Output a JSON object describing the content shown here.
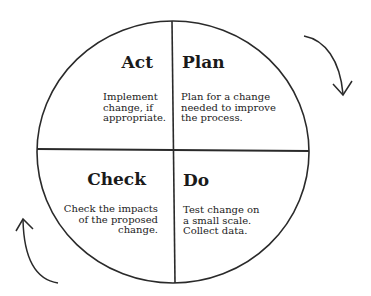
{
  "diagram": {
    "type": "PDCA cycle",
    "colors": {
      "stroke": "#2a2a2a",
      "text": "#1a1a1a",
      "background": "#ffffff"
    },
    "cycle_direction": "clockwise",
    "quadrants": {
      "act": {
        "title": "Act",
        "lines": [
          "Implement",
          "change, if",
          "appropriate."
        ]
      },
      "plan": {
        "title": "Plan",
        "lines": [
          "Plan for a change",
          "needed to improve",
          "the process."
        ]
      },
      "check": {
        "title": "Check",
        "lines": [
          "Check the impacts",
          "of the proposed",
          "change."
        ]
      },
      "do": {
        "title": "Do",
        "lines": [
          "Test change on",
          "a small scale.",
          "Collect data."
        ]
      }
    },
    "arrows": [
      {
        "name": "clockwise-arrow-top-right",
        "direction": "down"
      },
      {
        "name": "clockwise-arrow-bottom-left",
        "direction": "up"
      }
    ]
  }
}
